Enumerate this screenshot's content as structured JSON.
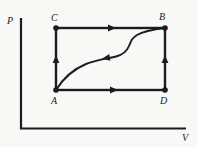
{
  "diagram": {
    "type": "pressure-volume-diagram",
    "axes": {
      "vertical_label": "P",
      "horizontal_label": "V"
    },
    "vertices": {
      "A": {
        "label": "A",
        "position": "bottom-left"
      },
      "B": {
        "label": "B",
        "position": "top-right"
      },
      "C": {
        "label": "C",
        "position": "top-left"
      },
      "D": {
        "label": "D",
        "position": "bottom-right"
      }
    },
    "processes": [
      {
        "from": "A",
        "to": "C",
        "shape": "vertical-line",
        "arrow_direction": "up"
      },
      {
        "from": "C",
        "to": "B",
        "shape": "horizontal-line",
        "arrow_direction": "right"
      },
      {
        "from": "A",
        "to": "D",
        "shape": "horizontal-line",
        "arrow_direction": "right"
      },
      {
        "from": "D",
        "to": "B",
        "shape": "vertical-line",
        "arrow_direction": "up"
      },
      {
        "from": "B",
        "to": "A",
        "shape": "s-curve",
        "arrow_direction": "toward-A"
      }
    ],
    "colors": {
      "line": "#1c1c1c",
      "background": "#f8f8f6"
    }
  }
}
